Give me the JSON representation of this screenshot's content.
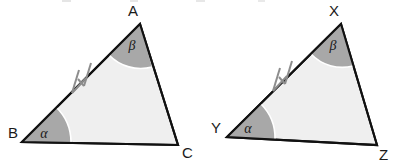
{
  "figure": {
    "kind": "geometry-diagram",
    "background_color": "#ffffff",
    "interior_fill": "#efefef",
    "angle_fill": "#a8a8a8",
    "outline_color": "#111111",
    "tick_color": "#8d8d8d",
    "arc_color": "#ffffff"
  },
  "triangles": [
    {
      "id": "triangle-abc",
      "name": "left-triangle",
      "vertices": [
        {
          "label": "B",
          "role": "bottom-left",
          "x": 22,
          "y": 142,
          "label_x": 8,
          "label_y": 138
        },
        {
          "label": "A",
          "role": "apex",
          "x": 140,
          "y": 24,
          "label_x": 128,
          "label_y": 16
        },
        {
          "label": "C",
          "role": "bottom-right",
          "x": 178,
          "y": 145,
          "label_x": 182,
          "label_y": 158
        }
      ],
      "angles": [
        {
          "label": "α",
          "at_vertex": "B",
          "label_x": 44,
          "label_y": 138
        },
        {
          "label": "β",
          "at_vertex": "A",
          "label_x": 132,
          "label_y": 50
        }
      ],
      "tick_marks": {
        "on_side": "BA",
        "count": 2,
        "x": 80,
        "y": 80
      }
    },
    {
      "id": "triangle-xyz",
      "name": "right-triangle",
      "vertices": [
        {
          "label": "Y",
          "role": "bottom-left",
          "x": 227,
          "y": 137,
          "label_x": 211,
          "label_y": 133
        },
        {
          "label": "X",
          "role": "apex",
          "x": 341,
          "y": 24,
          "label_x": 329,
          "label_y": 16
        },
        {
          "label": "Z",
          "role": "bottom-right",
          "x": 377,
          "y": 145,
          "label_x": 379,
          "label_y": 160
        }
      ],
      "angles": [
        {
          "label": "α",
          "at_vertex": "Y",
          "label_x": 248,
          "label_y": 133
        },
        {
          "label": "β",
          "at_vertex": "X",
          "label_x": 333,
          "label_y": 50
        }
      ],
      "tick_marks": {
        "on_side": "YX",
        "count": 2,
        "x": 281,
        "y": 78
      }
    }
  ]
}
